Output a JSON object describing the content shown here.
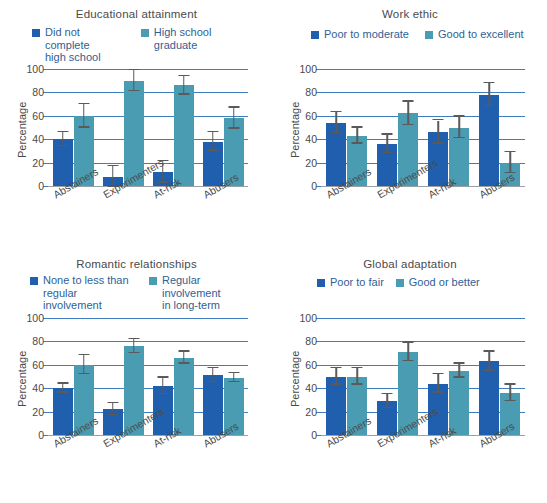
{
  "figure": {
    "y_axis_label": "Percentage",
    "y_ticks": [
      0,
      20,
      40,
      60,
      80,
      100
    ],
    "categories": [
      "Abstainers",
      "Experimenters",
      "At-risk",
      "Abusers"
    ],
    "colors": {
      "series1": "#1f5fae",
      "series2": "#4a9cb2",
      "gridline": "#3f7cc0",
      "text": "#4a4a4a",
      "legend_text": "#2e5f96"
    }
  },
  "chart_data": [
    {
      "type": "bar",
      "title": "Educational attainment",
      "xlabel": "",
      "ylabel": "Percentage",
      "ylim": [
        0,
        100
      ],
      "grid": true,
      "legend_position": "top",
      "categories": [
        "Abstainers",
        "Experimenters",
        "At-risk",
        "Abusers"
      ],
      "series": [
        {
          "name": "Did not complete\nhigh school",
          "color": "#1f5fae",
          "values": [
            40,
            8,
            12,
            38
          ],
          "errors": [
            6,
            9,
            9,
            8
          ]
        },
        {
          "name": "High school graduate",
          "color": "#4a9cb2",
          "values": [
            60,
            90,
            86,
            58
          ],
          "errors": [
            10,
            9,
            8,
            9
          ]
        }
      ]
    },
    {
      "type": "bar",
      "title": "Work ethic",
      "xlabel": "",
      "ylabel": "Percentage",
      "ylim": [
        0,
        100
      ],
      "grid": true,
      "legend_position": "top",
      "categories": [
        "Abstainers",
        "Experimenters",
        "At-risk",
        "Abusers"
      ],
      "series": [
        {
          "name": "Poor to moderate",
          "color": "#1f5fae",
          "values": [
            54,
            36,
            46,
            78
          ],
          "errors": [
            9,
            8,
            10,
            10
          ]
        },
        {
          "name": "Good to excellent",
          "color": "#4a9cb2",
          "values": [
            43,
            62,
            50,
            20
          ],
          "errors": [
            7,
            10,
            9,
            9
          ]
        }
      ]
    },
    {
      "type": "bar",
      "title": "Romantic relationships",
      "xlabel": "",
      "ylabel": "Percentage",
      "ylim": [
        0,
        100
      ],
      "grid": true,
      "legend_position": "top",
      "categories": [
        "Abstainers",
        "Experimenters",
        "At-risk",
        "Abusers"
      ],
      "series": [
        {
          "name": "None to less than\nregular involvement",
          "color": "#1f5fae",
          "values": [
            40,
            22,
            42,
            51
          ],
          "errors": [
            4,
            5,
            7,
            6
          ]
        },
        {
          "name": "Regular involvement\nin long-term",
          "color": "#4a9cb2",
          "values": [
            60,
            76,
            66,
            49
          ],
          "errors": [
            8,
            6,
            5,
            4
          ]
        }
      ]
    },
    {
      "type": "bar",
      "title": "Global adaptation",
      "xlabel": "",
      "ylabel": "Percentage",
      "ylim": [
        0,
        100
      ],
      "grid": true,
      "legend_position": "top",
      "categories": [
        "Abstainers",
        "Experimenters",
        "At-risk",
        "Abusers"
      ],
      "series": [
        {
          "name": "Poor to fair",
          "color": "#1f5fae",
          "values": [
            50,
            29,
            44,
            63
          ],
          "errors": [
            7,
            6,
            8,
            8
          ]
        },
        {
          "name": "Good or better",
          "color": "#4a9cb2",
          "values": [
            50,
            71,
            55,
            36
          ],
          "errors": [
            7,
            8,
            6,
            7
          ]
        }
      ]
    }
  ]
}
